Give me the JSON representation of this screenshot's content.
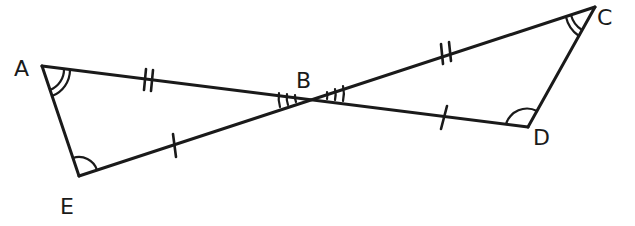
{
  "diagram": {
    "type": "geometry-figure",
    "stroke_color": "#1a1a1a",
    "background_color": "#ffffff",
    "points": {
      "A": {
        "label": "A",
        "x": 42,
        "y": 66,
        "label_x": 14,
        "label_y": 76
      },
      "B": {
        "label": "B",
        "x": 311,
        "y": 97,
        "label_x": 296,
        "label_y": 88
      },
      "C": {
        "label": "C",
        "x": 595,
        "y": 7,
        "label_x": 597,
        "label_y": 25
      },
      "D": {
        "label": "D",
        "x": 528,
        "y": 127,
        "label_x": 533,
        "label_y": 145
      },
      "E": {
        "label": "E",
        "x": 79,
        "y": 176,
        "label_x": 60,
        "label_y": 214
      }
    },
    "segments": [
      {
        "from": "A",
        "to": "B",
        "tick_marks": 2
      },
      {
        "from": "B",
        "to": "D",
        "tick_marks": 1
      },
      {
        "from": "E",
        "to": "B",
        "tick_marks": 1
      },
      {
        "from": "B",
        "to": "C",
        "tick_marks": 2
      },
      {
        "from": "A",
        "to": "E",
        "tick_marks": 0
      },
      {
        "from": "C",
        "to": "D",
        "tick_marks": 0
      }
    ],
    "angle_marks": [
      {
        "vertex": "A",
        "arcs": 2
      },
      {
        "vertex": "C",
        "arcs": 2
      },
      {
        "vertex": "E",
        "arcs": 1
      },
      {
        "vertex": "D",
        "arcs": 1
      },
      {
        "vertex": "B",
        "side": "ABE",
        "arcs": 3
      },
      {
        "vertex": "B",
        "side": "CBD",
        "arcs": 3
      }
    ],
    "congruences": [
      "AB = BC (double tick)",
      "EB = BD (single tick)",
      "angle A = angle C (double arc)",
      "angle E = angle D (single arc)",
      "angle ABE = angle CBD (triple arc, vertical angles)"
    ]
  }
}
